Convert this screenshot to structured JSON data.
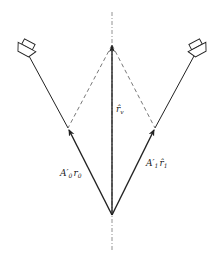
{
  "diagram": {
    "type": "vector-panning-geometry",
    "colors": {
      "stroke": "#222222",
      "dashed": "#555555",
      "axis": "#777777",
      "background": "#ffffff"
    },
    "labels": {
      "center_vector": {
        "base": "r̂",
        "sub": "v"
      },
      "left_vector": {
        "base": "A′",
        "sub": "0",
        "tail": "r",
        "tail_sub": "0"
      },
      "right_vector": {
        "base": "A′",
        "sub": "1",
        "tail": "r̂",
        "tail_sub": "1"
      }
    },
    "elements": {
      "left_speaker": "loudspeaker-icon",
      "right_speaker": "loudspeaker-icon",
      "axis": "dash-dot center axis"
    }
  }
}
